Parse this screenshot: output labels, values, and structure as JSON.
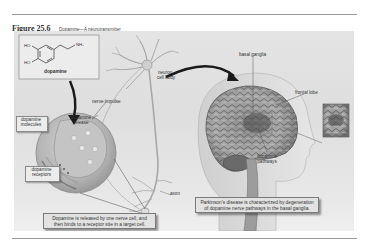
{
  "figure": {
    "number": "Figure 25.6",
    "title": "Dopamine—A neurotransmitter"
  },
  "molecule": {
    "label": "dopamine",
    "groups": {
      "hydroxyl_top": "HO",
      "hydroxyl_bottom": "HO",
      "amine": "NH₂"
    }
  },
  "labels": {
    "nerve_impulse": "nerve impulse",
    "neuron_cell_body": "neuron\ncell body",
    "neuron": "neuron",
    "cell_body": "cell body",
    "dopamine_molecules_1": "dopamine",
    "dopamine_molecules_2": "molecules",
    "dopamine_release_1": "dopamine",
    "dopamine_release_2": "release",
    "dopamine_receptors_1": "dopamine",
    "dopamine_receptors_2": "receptors",
    "axon": "axon",
    "basal_ganglia": "basal ganglia",
    "frontal_lobe": "frontal lobe",
    "dopamine_pathways_1": "dopamine",
    "dopamine_pathways_2": "pathways"
  },
  "captions": {
    "synapse_1": "Dopamine is released by one nerve cell, and",
    "synapse_2": "then binds to a receptor site in a target cell.",
    "parkinsons_1": "Parkinson’s disease is characterized by degeneration",
    "parkinsons_2": "of dopamine nerve pathways in the basal ganglia."
  }
}
